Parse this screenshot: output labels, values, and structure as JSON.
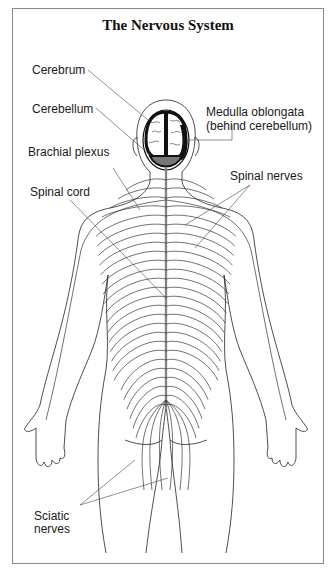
{
  "title": "The Nervous System",
  "labels": {
    "cerebrum": "Cerebrum",
    "cerebellum": "Cerebellum",
    "medulla_line1": "Medulla oblongata",
    "medulla_line2": "(behind cerebellum)",
    "brachial_plexus": "Brachial plexus",
    "spinal_nerves": "Spinal nerves",
    "spinal_cord": "Spinal cord",
    "sciatic_line1": "Sciatic",
    "sciatic_line2": "nerves"
  }
}
